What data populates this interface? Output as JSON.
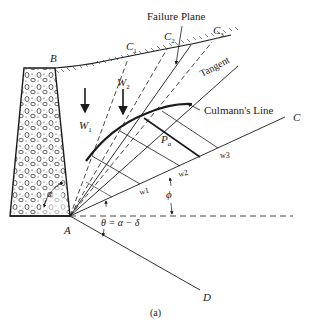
{
  "figure": {
    "caption": "(a)",
    "title_annotation": "Failure Plane",
    "tangent_label": "Tangent",
    "culmann_label": "Culmann's Line",
    "theta_label": "θ = α − δ",
    "alpha_label": "α",
    "phi_label": "ϕ",
    "pa_label": "P",
    "pa_sub": "a",
    "points": {
      "A": "A",
      "B": "B",
      "C": "C",
      "D": "D",
      "C1": "C",
      "C1_sub": "1",
      "C2": "C",
      "C2_sub": "2",
      "C3": "C",
      "C3_sub": "3"
    },
    "weights": {
      "W1": "W",
      "W1_sub": "1",
      "W2": "W",
      "W2_sub": "2"
    },
    "ticks": {
      "w1": "w1",
      "w2": "w2",
      "w3": "w3"
    }
  },
  "colors": {
    "ink": "#1a1a1a",
    "background": "#ffffff"
  }
}
